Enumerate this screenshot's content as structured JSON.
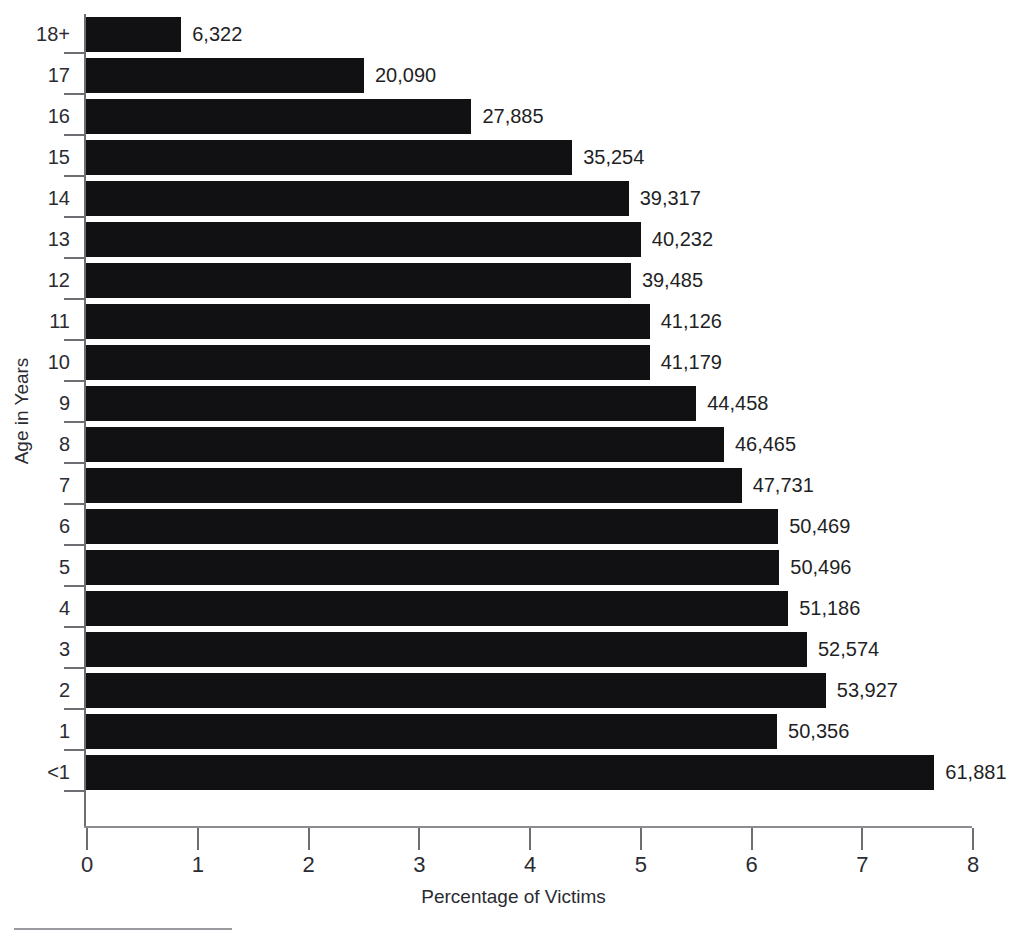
{
  "chart_data": {
    "type": "bar",
    "orientation": "horizontal",
    "title": "",
    "xlabel": "Percentage of Victims",
    "ylabel": "Age in Years",
    "xlim": [
      0,
      8
    ],
    "xticks": [
      "0",
      "1",
      "2",
      "3",
      "4",
      "5",
      "6",
      "7",
      "8"
    ],
    "grid": false,
    "legend": null,
    "categories": [
      "18+",
      "17",
      "16",
      "15",
      "14",
      "13",
      "12",
      "11",
      "10",
      "9",
      "8",
      "7",
      "6",
      "5",
      "4",
      "3",
      "2",
      "1",
      "<1"
    ],
    "values": [
      0.86,
      2.51,
      3.48,
      4.39,
      4.9,
      5.01,
      4.92,
      5.09,
      5.09,
      5.51,
      5.76,
      5.92,
      6.25,
      6.26,
      6.34,
      6.51,
      6.68,
      6.24,
      7.66
    ],
    "data_labels": [
      "6,322",
      "20,090",
      "27,885",
      "35,254",
      "39,317",
      "40,232",
      "39,485",
      "41,126",
      "41,179",
      "44,458",
      "46,465",
      "47,731",
      "50,469",
      "50,496",
      "51,186",
      "52,574",
      "53,927",
      "50,356",
      "61,881"
    ],
    "counts": [
      6322,
      20090,
      27885,
      35254,
      39317,
      40232,
      39485,
      41126,
      41179,
      44458,
      46465,
      47731,
      50469,
      50496,
      51186,
      52574,
      53927,
      50356,
      61881
    ],
    "bar_color": "#111114",
    "axis_color": "#6d6d72",
    "background": "#ffffff"
  },
  "axes": {
    "x_title": "Percentage of Victims",
    "y_title": "Age in Years"
  },
  "title_sliver": ""
}
